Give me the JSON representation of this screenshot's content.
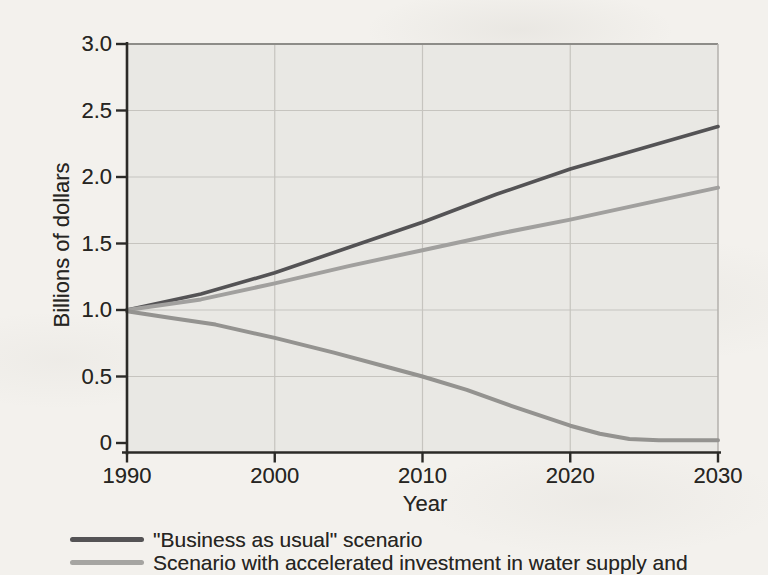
{
  "figure": {
    "background_color": "#f3f1ed",
    "text_color": "#262522"
  },
  "chart_data": {
    "type": "line",
    "title": "",
    "xlabel": "Year",
    "ylabel": "Billions of dollars",
    "xlim": [
      1990,
      2030
    ],
    "ylim": [
      0,
      3.0
    ],
    "x_ticks": [
      "1990",
      "2000",
      "2010",
      "2020",
      "2030"
    ],
    "x_tick_values": [
      1990,
      2000,
      2010,
      2020,
      2030
    ],
    "y_ticks": [
      "3.0",
      "2.5",
      "2.0",
      "1.5",
      "1.0",
      "0.5",
      "0"
    ],
    "y_tick_values": [
      3.0,
      2.5,
      2.0,
      1.5,
      1.0,
      0.5,
      0
    ],
    "grid": true,
    "plot_background": "#e9e8e4",
    "grid_color": "#c6c4bf",
    "axis_color": "#2b2a27",
    "frame_top_color": "#8d8c88",
    "frame_right_color": "#b3b1ac",
    "series": [
      {
        "name": "\"Business as usual\" scenario",
        "color": "#545355",
        "stroke_width": 3.6,
        "x": [
          1990,
          1995,
          2000,
          2005,
          2010,
          2015,
          2020,
          2025,
          2030
        ],
        "y": [
          1.0,
          1.12,
          1.28,
          1.47,
          1.66,
          1.87,
          2.06,
          2.22,
          2.38
        ]
      },
      {
        "name": "Scenario with accelerated investment in water supply and",
        "color": "#a1a09e",
        "stroke_width": 4,
        "x": [
          1990,
          1995,
          2000,
          2005,
          2010,
          2015,
          2020,
          2025,
          2030
        ],
        "y": [
          1.0,
          1.08,
          1.2,
          1.33,
          1.45,
          1.57,
          1.68,
          1.8,
          1.92
        ]
      },
      {
        "name": "",
        "color": "#949390",
        "stroke_width": 4,
        "x": [
          1990,
          1993,
          1996,
          2000,
          2004,
          2008,
          2010,
          2013,
          2016,
          2020,
          2022,
          2024,
          2026,
          2030
        ],
        "y": [
          0.99,
          0.94,
          0.89,
          0.79,
          0.68,
          0.56,
          0.5,
          0.4,
          0.28,
          0.13,
          0.07,
          0.03,
          0.02,
          0.02
        ]
      }
    ],
    "legend": {
      "position": "bottom-left",
      "entries": [
        {
          "label": "\"Business as usual\" scenario",
          "color": "#545355"
        },
        {
          "label": "Scenario with accelerated investment in water supply and",
          "color": "#a6a5a2"
        }
      ]
    }
  }
}
